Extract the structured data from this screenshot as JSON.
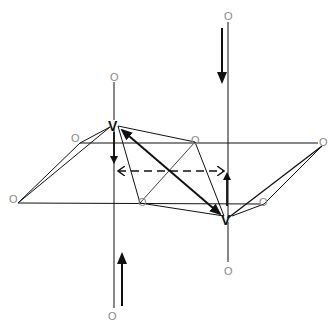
{
  "diagram": {
    "title": "",
    "colors": {
      "line": "#111111",
      "atom_label": "#888888",
      "background": "#ffffff"
    },
    "vertex_labels": {
      "upper_left_v": "V",
      "lower_right_v": "V"
    },
    "atom_labels": {
      "top_far": "O",
      "apical_upper_v": "O",
      "apical_lower_v": "O",
      "bottom_far": "O",
      "left": "O",
      "upper_left": "O",
      "upper_right": "O",
      "right": "O",
      "lower_mid": "O",
      "lower_right": "O"
    },
    "arrows": [
      {
        "id": "top-down-arrow",
        "direction": "down",
        "style": "solid"
      },
      {
        "id": "bottom-up-arrow",
        "direction": "up",
        "style": "solid"
      },
      {
        "id": "v-upper-down-arrow",
        "direction": "down",
        "style": "solid"
      },
      {
        "id": "v-lower-up-arrow",
        "direction": "up",
        "style": "solid"
      },
      {
        "id": "dashed-double-arrow",
        "direction": "horizontal-both",
        "style": "dashed"
      },
      {
        "id": "diagonal-double-arrow",
        "direction": "diagonal-both",
        "style": "solid-bold"
      }
    ]
  }
}
